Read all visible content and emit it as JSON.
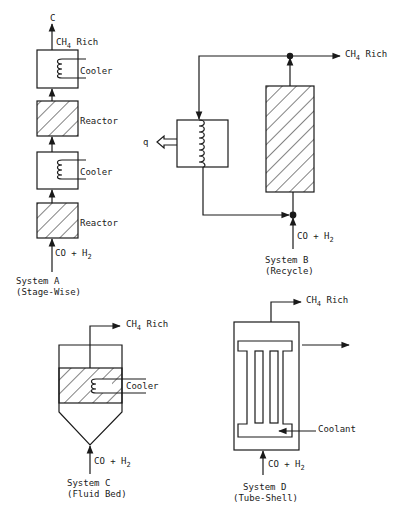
{
  "system_a": {
    "top_label": "C",
    "outlet_label_prefix": "CH",
    "outlet_label_sub": "4",
    "outlet_label_suffix": " Rich",
    "cooler_label_1": "Cooler",
    "reactor_label_1": "Reactor",
    "cooler_label_2": "Cooler",
    "reactor_label_2": "Reactor",
    "inlet_label_prefix": "CO + H",
    "inlet_label_sub": "2",
    "caption_line1": "System A",
    "caption_line2": "(Stage-Wise)"
  },
  "system_b": {
    "outlet_label_prefix": "CH",
    "outlet_label_sub": "4",
    "outlet_label_suffix": " Rich",
    "heat_label": "q",
    "inlet_label_prefix": "CO + H",
    "inlet_label_sub": "2",
    "caption_line1": "System B",
    "caption_line2": "(Recycle)"
  },
  "system_c": {
    "outlet_label_prefix": "CH",
    "outlet_label_sub": "4",
    "outlet_label_suffix": " Rich",
    "cooler_label": "Cooler",
    "inlet_label_prefix": "CO + H",
    "inlet_label_sub": "2",
    "caption_line1": "System C",
    "caption_line2": "(Fluid Bed)"
  },
  "system_d": {
    "outlet_label_prefix": "CH",
    "outlet_label_sub": "4",
    "outlet_label_suffix": " Rich",
    "coolant_label": "Coolant",
    "inlet_label_prefix": "CO + H",
    "inlet_label_sub": "2",
    "caption_line1": "System D",
    "caption_line2": "(Tube-Shell)"
  },
  "colors": {
    "ink": "#1a1a1a",
    "background": "#ffffff"
  }
}
